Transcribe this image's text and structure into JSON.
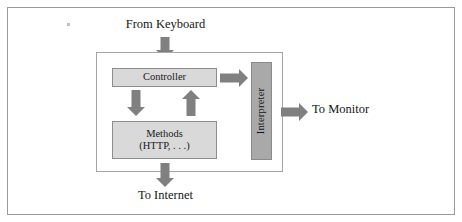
{
  "diagram": {
    "type": "block-diagram",
    "canvas": {
      "width": 462,
      "height": 222
    },
    "colors": {
      "outer_border": "#9a9a9a",
      "inner_border": "#a5a5a5",
      "box_fill_light": "#d9d9d9",
      "box_fill_dark": "#a9a9a9",
      "box_border": "#8d8d8d",
      "arrow_fill": "#808080",
      "text": "#161616",
      "background": "#ffffff"
    },
    "nodes": [
      {
        "id": "controller",
        "label": "Controller",
        "shape": "rectangle",
        "fill": "#d9d9d9",
        "orientation": "horizontal"
      },
      {
        "id": "methods",
        "label_line_1": "Methods",
        "label_line_2": "(HTTP, . . .)",
        "shape": "rectangle",
        "fill": "#d9d9d9",
        "orientation": "horizontal"
      },
      {
        "id": "interpreter",
        "label": "Interpreter",
        "shape": "rectangle",
        "fill": "#a9a9a9",
        "orientation": "vertical-rotated"
      }
    ],
    "external_labels": {
      "from_keyboard": "From Keyboard",
      "to_internet": "To Internet",
      "to_monitor": "To Monitor"
    },
    "arrows": [
      {
        "id": "keyboard-in",
        "direction": "down",
        "from": "From Keyboard",
        "to": "Controller"
      },
      {
        "id": "controller-to-methods",
        "direction": "down",
        "from": "Controller",
        "to": "Methods"
      },
      {
        "id": "methods-to-controller",
        "direction": "up",
        "from": "Methods",
        "to": "Controller"
      },
      {
        "id": "controller-to-interpreter",
        "direction": "right",
        "from": "Controller",
        "to": "Interpreter"
      },
      {
        "id": "interpreter-to-monitor",
        "direction": "right",
        "from": "Interpreter",
        "to": "To Monitor"
      },
      {
        "id": "methods-to-internet",
        "direction": "down",
        "from": "Methods",
        "to": "To Internet"
      }
    ]
  }
}
